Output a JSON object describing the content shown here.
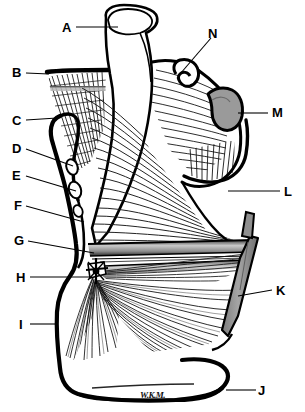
{
  "figure": {
    "style": "black-and-white line drawing with hatched muscle fiber striations",
    "signature": "W.K.M.",
    "background_color": "#ffffff",
    "ink_color": "#000000",
    "bone_fill_color": "#ffffff",
    "shaded_fill_color": "#9a9a9a",
    "tendon_band_color": "#b5b5b5"
  },
  "labels": [
    {
      "id": "A",
      "text": "A",
      "x": 62,
      "y": 21,
      "leader": "horizontal-right",
      "target_x": 118,
      "target_y": 27
    },
    {
      "id": "B",
      "text": "B",
      "x": 12,
      "y": 66,
      "leader": "horizontal-right",
      "target_x": 49,
      "target_y": 74
    },
    {
      "id": "C",
      "text": "C",
      "x": 12,
      "y": 114,
      "leader": "horizontal-right",
      "target_x": 55,
      "target_y": 118
    },
    {
      "id": "D",
      "text": "D",
      "x": 12,
      "y": 142,
      "leader": "diagonal-down-right",
      "target_x": 72,
      "target_y": 166
    },
    {
      "id": "E",
      "text": "E",
      "x": 12,
      "y": 169,
      "leader": "diagonal-down-right",
      "target_x": 75,
      "target_y": 190
    },
    {
      "id": "F",
      "text": "F",
      "x": 14,
      "y": 199,
      "leader": "diagonal-down-right",
      "target_x": 84,
      "target_y": 222
    },
    {
      "id": "G",
      "text": "G",
      "x": 14,
      "y": 234,
      "leader": "diagonal-down-right",
      "target_x": 93,
      "target_y": 252
    },
    {
      "id": "H",
      "text": "H",
      "x": 16,
      "y": 271,
      "leader": "horizontal-right",
      "target_x": 92,
      "target_y": 277
    },
    {
      "id": "I",
      "text": "I",
      "x": 19,
      "y": 318,
      "leader": "horizontal-right",
      "target_x": 56,
      "target_y": 324
    },
    {
      "id": "J",
      "text": "J",
      "x": 258,
      "y": 384,
      "leader": "horizontal-left",
      "target_x": 226,
      "target_y": 390
    },
    {
      "id": "K",
      "text": "K",
      "x": 276,
      "y": 284,
      "leader": "horizontal-left",
      "target_x": 240,
      "target_y": 290
    },
    {
      "id": "L",
      "text": "L",
      "x": 284,
      "y": 185,
      "leader": "horizontal-left",
      "target_x": 230,
      "target_y": 191
    },
    {
      "id": "M",
      "text": "M",
      "x": 272,
      "y": 106,
      "leader": "horizontal-left",
      "target_x": 239,
      "target_y": 113
    },
    {
      "id": "N",
      "text": "N",
      "x": 208,
      "y": 27,
      "leader": "diagonal-down-left",
      "target_x": 178,
      "target_y": 76
    }
  ]
}
